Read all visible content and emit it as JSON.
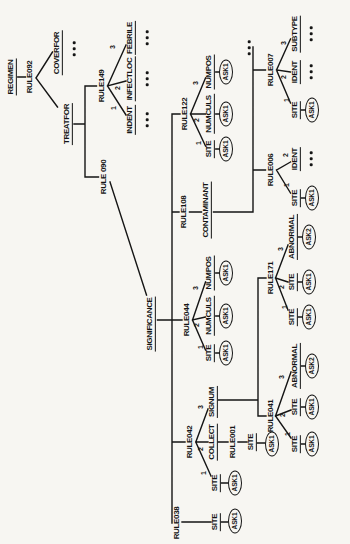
{
  "figure": {
    "colors": {
      "paper": "#f7f6f2",
      "ink": "#151515"
    }
  },
  "tree": {
    "id": "regimen",
    "label": "REGIMEN",
    "type": "param",
    "children": [
      {
        "id": "rule092",
        "label": "RULE092",
        "type": "rule",
        "children": [
          {
            "id": "treatfor",
            "label": "TREATFOR",
            "type": "param",
            "children": [
              {
                "id": "rule149",
                "label": "RULE149",
                "type": "rule",
                "children": [
                  {
                    "id": "indent",
                    "label": "INDENT",
                    "type": "param",
                    "branch": "1",
                    "children": [
                      {
                        "id": "indent-more",
                        "label": "...",
                        "type": "more"
                      }
                    ]
                  },
                  {
                    "id": "infectloc",
                    "label": "INFECTLOC",
                    "type": "param",
                    "branch": "2",
                    "children": [
                      {
                        "id": "infectloc-more",
                        "label": "...",
                        "type": "more"
                      }
                    ]
                  },
                  {
                    "id": "febrile",
                    "label": "FEBRILE",
                    "type": "param",
                    "branch": "3",
                    "children": [
                      {
                        "id": "febrile-more",
                        "label": "...",
                        "type": "more"
                      }
                    ]
                  }
                ]
              },
              {
                "id": "rule090",
                "label": "RULE 090",
                "type": "rule",
                "children": [
                  {
                    "id": "significance",
                    "label": "SIGNIFICANCE",
                    "type": "param",
                    "children": [
                      {
                        "id": "rule038",
                        "label": "RULE038",
                        "type": "rule",
                        "children": [
                          {
                            "id": "r038-site",
                            "label": "SITE",
                            "type": "param",
                            "children": [
                              {
                                "id": "r038-ask",
                                "label": "ASK1",
                                "type": "ask"
                              }
                            ]
                          }
                        ]
                      },
                      {
                        "id": "rule042",
                        "label": "RULE042",
                        "type": "rule",
                        "children": [
                          {
                            "id": "r042-site",
                            "label": "SITE",
                            "type": "param",
                            "branch": "1",
                            "children": [
                              {
                                "id": "r042-ask",
                                "label": "ASK1",
                                "type": "ask"
                              }
                            ]
                          },
                          {
                            "id": "collect",
                            "label": "COLLECT",
                            "type": "param",
                            "branch": "2",
                            "children": [
                              {
                                "id": "rule001",
                                "label": "RULE001",
                                "type": "rule",
                                "children": [
                                  {
                                    "id": "r001-site",
                                    "label": "SITE",
                                    "type": "param",
                                    "children": [
                                      {
                                        "id": "r001-ask",
                                        "label": "ASK1",
                                        "type": "ask"
                                      }
                                    ]
                                  }
                                ]
                              }
                            ]
                          },
                          {
                            "id": "signum",
                            "label": "SIGNUM",
                            "type": "param",
                            "branch": "3",
                            "children": [
                              {
                                "id": "rule041",
                                "label": "RULE041",
                                "type": "rule",
                                "children": [
                                  {
                                    "id": "r041-site1",
                                    "label": "SITE",
                                    "type": "param",
                                    "branch": "1",
                                    "children": [
                                      {
                                        "id": "r041-ask1",
                                        "label": "ASK1",
                                        "type": "ask"
                                      }
                                    ]
                                  },
                                  {
                                    "id": "r041-site2",
                                    "label": "SITE",
                                    "type": "param",
                                    "branch": "2",
                                    "children": [
                                      {
                                        "id": "r041-ask2",
                                        "label": "ASK1",
                                        "type": "ask"
                                      }
                                    ]
                                  },
                                  {
                                    "id": "r041-abnormal",
                                    "label": "ABNORMAL",
                                    "type": "param",
                                    "branch": "3",
                                    "children": [
                                      {
                                        "id": "r041-ask3",
                                        "label": "ASK2",
                                        "type": "ask"
                                      }
                                    ]
                                  }
                                ]
                              },
                              {
                                "id": "rule171",
                                "label": "RULE171",
                                "type": "rule",
                                "children": [
                                  {
                                    "id": "r171-site1",
                                    "label": "SITE",
                                    "type": "param",
                                    "branch": "1",
                                    "children": [
                                      {
                                        "id": "r171-ask1",
                                        "label": "ASK1",
                                        "type": "ask"
                                      }
                                    ]
                                  },
                                  {
                                    "id": "r171-site2",
                                    "label": "SITE",
                                    "type": "param",
                                    "branch": "2",
                                    "children": [
                                      {
                                        "id": "r171-ask2",
                                        "label": "ASK1",
                                        "type": "ask"
                                      }
                                    ]
                                  },
                                  {
                                    "id": "r171-abnormal",
                                    "label": "ABNORMAL",
                                    "type": "param",
                                    "branch": "3",
                                    "children": [
                                      {
                                        "id": "r171-ask3",
                                        "label": "ASK2",
                                        "type": "ask"
                                      }
                                    ]
                                  }
                                ]
                              }
                            ]
                          }
                        ]
                      },
                      {
                        "id": "rule044",
                        "label": "RULE044",
                        "type": "rule",
                        "children": [
                          {
                            "id": "r044-site",
                            "label": "SITE",
                            "type": "param",
                            "branch": "1",
                            "children": [
                              {
                                "id": "r044-ask1",
                                "label": "ASK1",
                                "type": "ask"
                              }
                            ]
                          },
                          {
                            "id": "r044-numculs",
                            "label": "NUMCULS",
                            "type": "param",
                            "branch": "2",
                            "children": [
                              {
                                "id": "r044-ask2",
                                "label": "ASK1",
                                "type": "ask"
                              }
                            ]
                          },
                          {
                            "id": "r044-numpos",
                            "label": "NUMPOS",
                            "type": "param",
                            "branch": "3",
                            "children": [
                              {
                                "id": "r044-ask3",
                                "label": "ASK1",
                                "type": "ask"
                              }
                            ]
                          }
                        ]
                      },
                      {
                        "id": "rule108",
                        "label": "RULE108",
                        "type": "rule",
                        "children": [
                          {
                            "id": "contaminant",
                            "label": "CONTAMINANT",
                            "type": "param",
                            "children": [
                              {
                                "id": "rule006",
                                "label": "RULE006",
                                "type": "rule",
                                "children": [
                                  {
                                    "id": "r006-site",
                                    "label": "SITE",
                                    "type": "param",
                                    "branch": "1",
                                    "children": [
                                      {
                                        "id": "r006-ask",
                                        "label": "ASK1",
                                        "type": "ask"
                                      }
                                    ]
                                  },
                                  {
                                    "id": "r006-ident",
                                    "label": "IDENT",
                                    "type": "param",
                                    "branch": "2",
                                    "children": [
                                      {
                                        "id": "r006-more",
                                        "label": "...",
                                        "type": "more"
                                      }
                                    ]
                                  }
                                ]
                              },
                              {
                                "id": "rule007",
                                "label": "RULE007",
                                "type": "rule",
                                "children": [
                                  {
                                    "id": "r007-site",
                                    "label": "SITE",
                                    "type": "param",
                                    "branch": "1",
                                    "children": [
                                      {
                                        "id": "r007-ask",
                                        "label": "ASK1",
                                        "type": "ask"
                                      }
                                    ]
                                  },
                                  {
                                    "id": "r007-ident",
                                    "label": "IDENT",
                                    "type": "param",
                                    "branch": "2",
                                    "children": [
                                      {
                                        "id": "r007-more2",
                                        "label": "...",
                                        "type": "more"
                                      }
                                    ]
                                  },
                                  {
                                    "id": "r007-subtype",
                                    "label": "SUBTYPE",
                                    "type": "param",
                                    "branch": "3",
                                    "children": [
                                      {
                                        "id": "r007-more3",
                                        "label": "...",
                                        "type": "more"
                                      }
                                    ]
                                  }
                                ]
                              },
                              {
                                "id": "contaminant-more",
                                "label": "...",
                                "type": "more"
                              }
                            ]
                          }
                        ]
                      },
                      {
                        "id": "rule122",
                        "label": "RULE122",
                        "type": "rule",
                        "children": [
                          {
                            "id": "r122-site",
                            "label": "SITE",
                            "type": "param",
                            "branch": "1",
                            "children": [
                              {
                                "id": "r122-ask1",
                                "label": "ASK1",
                                "type": "ask"
                              }
                            ]
                          },
                          {
                            "id": "r122-numculs",
                            "label": "NUMCULS",
                            "type": "param",
                            "branch": "2",
                            "children": [
                              {
                                "id": "r122-ask2",
                                "label": "ASK1",
                                "type": "ask"
                              }
                            ]
                          },
                          {
                            "id": "r122-numpos",
                            "label": "NUMPOS",
                            "type": "param",
                            "branch": "3",
                            "children": [
                              {
                                "id": "r122-ask3",
                                "label": "ASK1",
                                "type": "ask"
                              }
                            ]
                          }
                        ]
                      }
                    ]
                  }
                ]
              }
            ]
          },
          {
            "id": "coverfor",
            "label": "COVERFOR",
            "type": "param",
            "children": [
              {
                "id": "coverfor-more",
                "label": "...",
                "type": "more"
              }
            ]
          }
        ]
      }
    ]
  }
}
